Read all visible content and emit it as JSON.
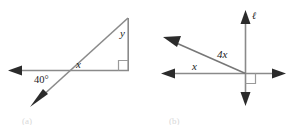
{
  "figure": {
    "background_color": "#ffffff",
    "line_color": "#8a8a8a",
    "label_color": "#1d1d1d",
    "arrow_color": "#2b2b2b",
    "panels": [
      {
        "id": "a",
        "caption": "(a)",
        "description": "right triangle with transversal ray",
        "labels": {
          "angle_40": "40°",
          "angle_x": "x",
          "angle_y": "y",
          "right_angle": "right-angle-marker"
        }
      },
      {
        "id": "b",
        "caption": "(b)",
        "description": "two intersecting lines with perpendicular vertical line",
        "labels": {
          "line_label": "ℓ",
          "angle_x": "x",
          "angle_4x": "4x",
          "right_angle": "right-angle-marker"
        }
      }
    ]
  }
}
